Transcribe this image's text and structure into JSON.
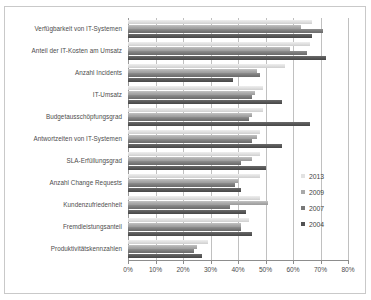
{
  "chart_data": {
    "type": "bar",
    "orientation": "horizontal",
    "title": "",
    "subtitle": "",
    "xlabel": "",
    "ylabel": "",
    "xlim": [
      0,
      80
    ],
    "xtick_labels": [
      "0%",
      "10%",
      "20%",
      "30%",
      "40%",
      "50%",
      "60%",
      "70%",
      "80%"
    ],
    "xtick_values": [
      0,
      10,
      20,
      30,
      40,
      50,
      60,
      70,
      80
    ],
    "grid": true,
    "legend_position": "right-middle",
    "categories": [
      "Verfügbarkeit von IT-Systemen",
      "Anteil der IT-Kosten am Umsatz",
      "Anzahl Incidents",
      "IT-Umsatz",
      "Budgetausschöpfungsgrad",
      "Antwortzeiten von IT-Systemen",
      "SLA-Erfüllungsgrad",
      "Anzahl Change Requests",
      "Kundenzufriedenheit",
      "Fremdleistungsanteil",
      "Produktivitätskennzahlen"
    ],
    "series": [
      {
        "name": "2013",
        "color": "#e2e2e2",
        "values": [
          67,
          66,
          57,
          49,
          49,
          48,
          48,
          48,
          48,
          44,
          29
        ]
      },
      {
        "name": "2009",
        "color": "#a9a9a9",
        "values": [
          63,
          59,
          47,
          46,
          45,
          47,
          45,
          40,
          51,
          41,
          25
        ]
      },
      {
        "name": "2007",
        "color": "#787878",
        "values": [
          71,
          65,
          48,
          45,
          44,
          45,
          41,
          39,
          37,
          41,
          24
        ]
      },
      {
        "name": "2004",
        "color": "#525252",
        "values": [
          67,
          72,
          38,
          56,
          66,
          56,
          50,
          41,
          43,
          45,
          27
        ]
      }
    ]
  },
  "legend": {
    "items": [
      {
        "label": "2013",
        "series": "s2013"
      },
      {
        "label": "2009",
        "series": "s2009"
      },
      {
        "label": "2007",
        "series": "s2007"
      },
      {
        "label": "2004",
        "series": "s2004"
      }
    ]
  }
}
